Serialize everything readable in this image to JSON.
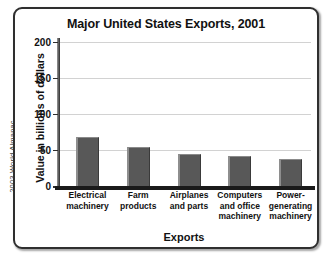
{
  "source_credit": "2003 World Almanac",
  "chart_data": {
    "type": "bar",
    "title": "Major United States Exports, 2001",
    "xlabel": "Exports",
    "ylabel": "Value in billions of dollars",
    "categories": [
      "Electrical machinery",
      "Farm products",
      "Airplanes and parts",
      "Computers and office machinery",
      "Power-generating machinery"
    ],
    "category_lines": [
      [
        "Electrical",
        "machinery"
      ],
      [
        "Farm",
        "products"
      ],
      [
        "Airplanes",
        "and parts"
      ],
      [
        "Computers",
        "and office",
        "machinery"
      ],
      [
        "Power-",
        "generating",
        "machinery"
      ]
    ],
    "values": [
      68,
      54,
      44,
      42,
      38
    ],
    "ylim": [
      0,
      215
    ],
    "yticks": [
      0,
      50,
      100,
      150,
      200
    ],
    "ytick_labels": [
      "0",
      "50",
      "100",
      "150",
      "200"
    ],
    "grid": true,
    "legend": false,
    "bar_color": "#585858",
    "axis_color": "#1a1a1a",
    "grid_color": "#d2d2d2",
    "frame_color": "#2f2f2f",
    "background": "#ffffff"
  }
}
